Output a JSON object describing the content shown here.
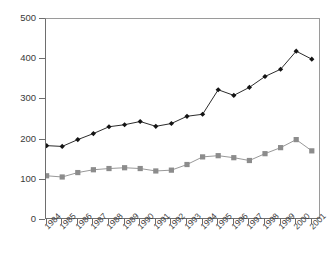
{
  "chart_data": {
    "type": "line",
    "title": "",
    "xlabel": "",
    "ylabel": "",
    "grid": false,
    "legend": "none",
    "ylim": [
      0,
      500
    ],
    "yticks": [
      0,
      100,
      200,
      300,
      400,
      500
    ],
    "categories": [
      "1984",
      "1985",
      "1986",
      "1987",
      "1988",
      "1989",
      "1990",
      "1991",
      "1992",
      "1993",
      "1994",
      "1995",
      "1996",
      "1997",
      "1998",
      "1999",
      "2000",
      "2001"
    ],
    "series": [
      {
        "name": "series-1",
        "marker": "diamond",
        "color": "#141414",
        "values": [
          185,
          183,
          200,
          215,
          232,
          237,
          245,
          233,
          240,
          258,
          263,
          324,
          310,
          330,
          357,
          375,
          420,
          400
        ]
      },
      {
        "name": "series-2",
        "marker": "square",
        "color": "#8c8c8c",
        "values": [
          110,
          107,
          118,
          125,
          128,
          130,
          128,
          122,
          124,
          138,
          157,
          160,
          155,
          148,
          165,
          180,
          200,
          172
        ]
      }
    ]
  },
  "axis": {
    "y_tick_labels": [
      "500",
      "400",
      "300",
      "200",
      "100",
      "0"
    ],
    "x_tick_labels": [
      "1984",
      "1985",
      "1986",
      "1987",
      "1988",
      "1989",
      "1990",
      "1991",
      "1992",
      "1993",
      "1994",
      "1995",
      "1996",
      "1997",
      "1998",
      "1999",
      "2000",
      "2001"
    ]
  },
  "colors": {
    "series_1": "#141414",
    "series_2": "#8c8c8c",
    "axis": "#6e6e6e",
    "text": "#3a3a3a",
    "background": "#ffffff"
  }
}
